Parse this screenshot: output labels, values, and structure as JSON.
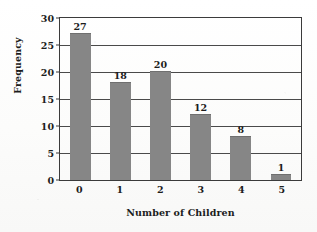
{
  "chart_data": {
    "type": "bar",
    "title": "",
    "categories": [
      "0",
      "1",
      "2",
      "3",
      "4",
      "5"
    ],
    "values": [
      27,
      18,
      20,
      12,
      8,
      1
    ],
    "data_labels": [
      "27",
      "18",
      "20",
      "12",
      "8",
      "1"
    ],
    "xlabel": "Number of Children",
    "ylabel": "Frequency",
    "ylim": [
      0,
      30
    ],
    "ytick_labels": [
      "0",
      "5",
      "10",
      "15",
      "20",
      "25",
      "30"
    ],
    "ytick_values": [
      0,
      5,
      10,
      15,
      20,
      25,
      30
    ],
    "grid": true,
    "grid_axis": "y",
    "legend": false,
    "legend_position": "none",
    "colors": {
      "bar_fill": "#868686",
      "axis_line": "#3b3b3b",
      "gridline": "#4a4a4a",
      "text": "#1c1c1c",
      "background": "#fdfdfc"
    }
  }
}
